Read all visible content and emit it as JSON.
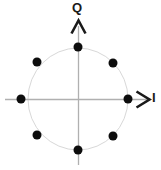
{
  "figure": {
    "width": 161,
    "height": 170,
    "background_color": "#ffffff"
  },
  "axes": {
    "vertical": {
      "label": "Q",
      "label_name": "quadrature-axis-label",
      "color": "#b0b0b0",
      "x": 78,
      "y_start": 20,
      "y_end": 165,
      "arrow": "up"
    },
    "horizontal": {
      "label": "I",
      "label_name": "inphase-axis-label",
      "color": "#b0b0b0",
      "y": 99,
      "x_start": 5,
      "x_end": 150,
      "arrow": "right"
    },
    "origin": {
      "x": 78,
      "y": 99
    }
  },
  "unit_circle": {
    "center_x": 78,
    "center_y": 99,
    "radius_x": 50,
    "radius_y": 51,
    "stroke_color": "#d8d8d8",
    "stroke_width": 1,
    "fill": "none"
  },
  "chart_data": {
    "type": "scatter",
    "xlabel": "I",
    "ylabel": "Q",
    "xlim": [
      -1.45,
      1.45
    ],
    "ylim": [
      -1.35,
      1.35
    ],
    "grid": false,
    "legend": null,
    "marker_color": "#0d0d0d",
    "marker_radius_px": 4.5,
    "series": [
      {
        "name": "8-PSK symbols",
        "points": [
          {
            "label": "0°",
            "angle_deg": 0,
            "i": 1.0,
            "q": 0.0,
            "px": 128,
            "py": 99
          },
          {
            "label": "45°",
            "angle_deg": 45,
            "i": 0.707,
            "q": 0.707,
            "px": 113,
            "py": 63
          },
          {
            "label": "90°",
            "angle_deg": 90,
            "i": 0.0,
            "q": 1.0,
            "px": 78,
            "py": 47
          },
          {
            "label": "135°",
            "angle_deg": 135,
            "i": -0.707,
            "q": 0.707,
            "px": 37,
            "py": 62
          },
          {
            "label": "180°",
            "angle_deg": 180,
            "i": -1.0,
            "q": 0.0,
            "px": 21,
            "py": 99
          },
          {
            "label": "225°",
            "angle_deg": 225,
            "i": -0.707,
            "q": -0.707,
            "px": 37,
            "py": 135
          },
          {
            "label": "270°",
            "angle_deg": 270,
            "i": 0.0,
            "q": -1.0,
            "px": 78,
            "py": 150
          },
          {
            "label": "315°",
            "angle_deg": 315,
            "i": 0.707,
            "q": -0.707,
            "px": 113,
            "py": 136
          }
        ]
      }
    ]
  }
}
